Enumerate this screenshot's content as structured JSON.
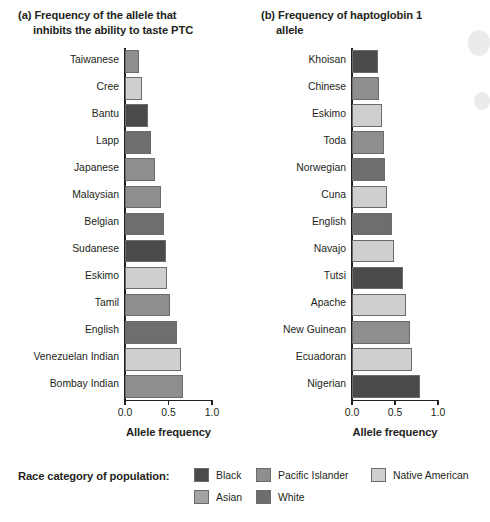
{
  "chart_data": [
    {
      "type": "bar",
      "panel_label": "(a)",
      "title": "Frequency of the allele that inhibits the ability to taste PTC",
      "title_lines": [
        "(a) Frequency of the allele that",
        "inhibits the ability to taste PTC"
      ],
      "orientation": "horizontal",
      "xlabel": "Allele frequency",
      "ylabel": "",
      "xlim": [
        0.0,
        1.0
      ],
      "xticks": [
        0.0,
        0.5,
        1.0
      ],
      "xticklabels": [
        "0.0",
        "0.5",
        "1.0"
      ],
      "grid": false,
      "categories": [
        "Taiwanese",
        "Cree",
        "Bantu",
        "Lapp",
        "Japanese",
        "Malaysian",
        "Belgian",
        "Sudanese",
        "Eskimo",
        "Tamil",
        "English",
        "Venezuelan Indian",
        "Bombay Indian"
      ],
      "values": [
        0.16,
        0.19,
        0.26,
        0.3,
        0.34,
        0.41,
        0.45,
        0.47,
        0.48,
        0.52,
        0.6,
        0.64,
        0.67
      ],
      "race_categories": [
        "Pacific Islander",
        "Native American",
        "Black",
        "White",
        "Pacific Islander",
        "Pacific Islander",
        "White",
        "Black",
        "Native American",
        "Pacific Islander",
        "White",
        "Native American",
        "Pacific Islander"
      ]
    },
    {
      "type": "bar",
      "panel_label": "(b)",
      "title": "Frequency of haptoglobin 1 allele",
      "title_lines": [
        "(b) Frequency of haptoglobin 1",
        "allele"
      ],
      "orientation": "horizontal",
      "xlabel": "Allele frequency",
      "ylabel": "",
      "xlim": [
        0.0,
        1.0
      ],
      "xticks": [
        0.0,
        0.5,
        1.0
      ],
      "xticklabels": [
        "0.0",
        "0.5",
        "1.0"
      ],
      "grid": false,
      "categories": [
        "Khoisan",
        "Chinese",
        "Eskimo",
        "Toda",
        "Norwegian",
        "Cuna",
        "English",
        "Navajo",
        "Tutsi",
        "Apache",
        "New Guinean",
        "Ecuadoran",
        "Nigerian"
      ],
      "values": [
        0.3,
        0.31,
        0.35,
        0.37,
        0.38,
        0.41,
        0.46,
        0.49,
        0.59,
        0.63,
        0.67,
        0.7,
        0.79
      ],
      "race_categories": [
        "Black",
        "Pacific Islander",
        "Native American",
        "Pacific Islander",
        "White",
        "Native American",
        "White",
        "Native American",
        "Black",
        "Native American",
        "Pacific Islander",
        "Native American",
        "Black"
      ]
    }
  ],
  "legend": {
    "title": "Race category of population:",
    "items": [
      {
        "label": "Black",
        "color": "#4a4a4a",
        "col": 0,
        "row": 0
      },
      {
        "label": "Asian",
        "color": "#a3a3a3",
        "col": 0,
        "row": 1
      },
      {
        "label": "Pacific Islander",
        "color": "#8e8e8e",
        "col": 1,
        "row": 0
      },
      {
        "label": "White",
        "color": "#6e6e6e",
        "col": 1,
        "row": 1
      },
      {
        "label": "Native American",
        "color": "#cfcfcf",
        "col": 2,
        "row": 0
      }
    ]
  },
  "colors": {
    "Black": "#4a4a4a",
    "Asian": "#a3a3a3",
    "Pacific Islander": "#8e8e8e",
    "White": "#6e6e6e",
    "Native American": "#cfcfcf",
    "axis": "#231f20",
    "background": "#ffffff"
  }
}
